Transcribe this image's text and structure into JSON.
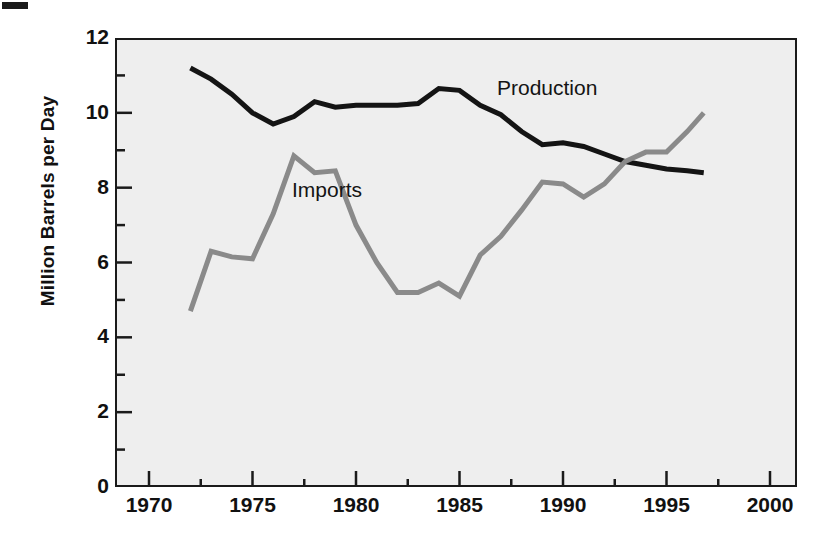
{
  "chart_data": {
    "type": "line",
    "title": "",
    "xlabel": "",
    "ylabel": "Million Barrels per Day",
    "xlim": [
      1970,
      2000
    ],
    "ylim": [
      0,
      12
    ],
    "grid": false,
    "legend_position": "inline-annotations",
    "x_ticks": [
      1970,
      1975,
      1980,
      1985,
      1990,
      1995,
      2000
    ],
    "x_minor_ticks": [
      1972.5,
      1977.5,
      1982.5,
      1987.5,
      1992.5,
      1997.5
    ],
    "y_ticks": [
      0,
      2,
      4,
      6,
      8,
      10,
      12
    ],
    "y_minor_ticks": [
      1,
      3,
      5,
      7,
      9,
      11
    ],
    "x": [
      1972,
      1973,
      1974,
      1975,
      1976,
      1977,
      1978,
      1979,
      1980,
      1981,
      1982,
      1983,
      1984,
      1985,
      1986,
      1987,
      1988,
      1989,
      1990,
      1991,
      1992,
      1993,
      1994,
      1995,
      1996,
      1996.8
    ],
    "series": [
      {
        "name": "Production",
        "color": "#141414",
        "linewidth": 5,
        "values": [
          11.2,
          10.9,
          10.5,
          10.0,
          9.7,
          9.9,
          10.3,
          10.15,
          10.2,
          10.2,
          10.2,
          10.25,
          10.65,
          10.6,
          10.2,
          9.95,
          9.5,
          9.15,
          9.2,
          9.1,
          8.9,
          8.7,
          8.6,
          8.5,
          8.45,
          8.4
        ]
      },
      {
        "name": "Imports",
        "color": "#8a8a8a",
        "linewidth": 5,
        "values": [
          4.7,
          6.3,
          6.15,
          6.1,
          7.3,
          8.85,
          8.4,
          8.45,
          7.0,
          6.0,
          5.2,
          5.2,
          5.45,
          5.1,
          6.2,
          6.7,
          7.4,
          8.15,
          8.1,
          7.75,
          8.1,
          8.7,
          8.95,
          8.95,
          9.5,
          10.0
        ]
      }
    ],
    "annotations": [
      {
        "text": "Production",
        "x": 1988.0,
        "y": 11.15
      },
      {
        "text": "Imports",
        "x": 1978.5,
        "y": 8.35
      }
    ]
  },
  "axis": {
    "y_title": "Million Barrels per Day",
    "y_tick_labels": [
      "12",
      "10",
      "8",
      "6",
      "4",
      "2",
      "0"
    ],
    "x_tick_labels": [
      "1970",
      "1975",
      "1980",
      "1985",
      "1990",
      "1995",
      "2000"
    ]
  },
  "colors": {
    "plot_background": "#eeeeee",
    "axis": "#1a1a1a",
    "production": "#141414",
    "imports": "#8a8a8a",
    "page_background": "#ffffff"
  }
}
